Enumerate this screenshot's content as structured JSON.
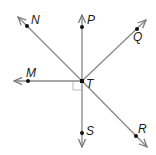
{
  "diagram": {
    "type": "geometry-rays",
    "vertex": {
      "label": "T",
      "x": 82,
      "y": 81
    },
    "line_color": "#888888",
    "point_color": "#111111",
    "rays": [
      {
        "name": "ray-TN",
        "label": "N",
        "point": [
          27,
          26
        ],
        "tip": [
          18,
          17
        ],
        "label_pos": [
          31,
          24
        ]
      },
      {
        "name": "ray-TP",
        "label": "P",
        "point": [
          82,
          27
        ],
        "tip": [
          82,
          15
        ],
        "label_pos": [
          87,
          24
        ]
      },
      {
        "name": "ray-TQ",
        "label": "Q",
        "point": [
          137,
          29
        ],
        "tip": [
          146,
          20
        ],
        "label_pos": [
          133,
          41
        ]
      },
      {
        "name": "ray-TM",
        "label": "M",
        "point": [
          28,
          81
        ],
        "tip": [
          14,
          81
        ],
        "label_pos": [
          26,
          77
        ]
      },
      {
        "name": "ray-TS",
        "label": "S",
        "point": [
          82,
          133
        ],
        "tip": [
          82,
          147
        ],
        "label_pos": [
          86,
          135
        ]
      },
      {
        "name": "ray-TR",
        "label": "R",
        "point": [
          136,
          136
        ],
        "tip": [
          147,
          147
        ],
        "label_pos": [
          138,
          133
        ]
      }
    ],
    "vertex_label_pos": [
      86,
      88
    ],
    "right_angle_marker": {
      "between": [
        "M",
        "S"
      ],
      "size": 9
    }
  }
}
